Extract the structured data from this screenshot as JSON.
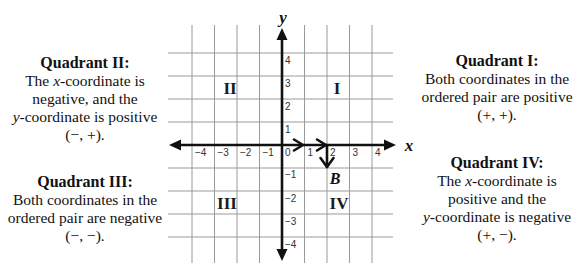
{
  "diagram": {
    "axis_labels": {
      "x": "x",
      "y": "y"
    },
    "x_ticks": [
      "−4",
      "−3",
      "−2",
      "−1",
      "0",
      "1",
      "2",
      "3",
      "4"
    ],
    "y_ticks": [
      "4",
      "3",
      "2",
      "1",
      "−1",
      "−2",
      "−3",
      "−4"
    ],
    "quadrant_numerals": {
      "I": "I",
      "II": "II",
      "III": "III",
      "IV": "IV"
    },
    "point": {
      "label": "B",
      "x": 2,
      "y": -1
    },
    "moves": [
      {
        "direction": "right",
        "units": 2
      },
      {
        "direction": "down",
        "units": 1
      }
    ],
    "colors": {
      "axis": "#111111",
      "grid": "#9a9a9a",
      "text": "#111111"
    }
  },
  "panels": {
    "q2": {
      "title": "Quadrant II:",
      "l1_pre": "The ",
      "l1_var": "x",
      "l1_post": "-coordinate is",
      "l2": "negative, and the",
      "l3_var": "y",
      "l3_post": "-coordinate is positive",
      "signs": "(−, +)."
    },
    "q1": {
      "title": "Quadrant I:",
      "l1": "Both coordinates in the",
      "l2": "ordered pair are positive",
      "signs": "(+, +)."
    },
    "q3": {
      "title": "Quadrant III:",
      "l1": "Both coordinates in the",
      "l2": "ordered pair are negative",
      "signs": "(−, −)."
    },
    "q4": {
      "title": "Quadrant IV:",
      "l1_pre": "The ",
      "l1_var": "x",
      "l1_post": "-coordinate is",
      "l2": "positive and the",
      "l3_var": "y",
      "l3_post": "-coordinate is negative",
      "signs": "(+, −)."
    }
  }
}
